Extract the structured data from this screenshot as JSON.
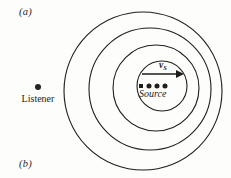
{
  "figure": {
    "background_color": "#fdfdfc",
    "stroke_color": "#211e1c",
    "panel_a_label": "(a)",
    "panel_b_label": "(b)"
  },
  "listener": {
    "label": "Listener",
    "dot_color": "#26221f",
    "x": 38,
    "y": 86
  },
  "source": {
    "label": "Source",
    "velocity_symbol": "v",
    "velocity_subscript": "S",
    "dot_color": "#211d1b",
    "x": 162,
    "y": 86
  },
  "arrow": {
    "name": "velocity-arrow",
    "x1": 142,
    "y1": 74,
    "x2": 184,
    "y2": 74,
    "color": "#1f1b19"
  },
  "chart_data": {
    "type": "scatter",
    "xlabel": "",
    "ylabel": "",
    "xlim": [
      0,
      231
    ],
    "ylim": [
      0,
      178
    ],
    "grid": false,
    "legend": "none",
    "annotations": [
      "(a)",
      "(b)",
      "Listener",
      "Source",
      "vS"
    ],
    "wavefronts": [
      {
        "name": "wavefront-4-outer",
        "cx": 143,
        "cy": 91,
        "r": 79,
        "stroke": "#211e1c",
        "stroke_width": 1.1
      },
      {
        "name": "wavefront-3",
        "cx": 150,
        "cy": 89,
        "r": 61,
        "stroke": "#211e1c",
        "stroke_width": 1.1
      },
      {
        "name": "wavefront-2",
        "cx": 156,
        "cy": 88,
        "r": 43,
        "stroke": "#211e1c",
        "stroke_width": 1.1
      },
      {
        "name": "wavefront-1-inner",
        "cx": 162,
        "cy": 86,
        "r": 25,
        "stroke": "#211e1c",
        "stroke_width": 1.1
      }
    ],
    "source_positions": [
      {
        "name": "source-origin-marker",
        "x": 141,
        "y": 86,
        "shape": "square",
        "size": 4
      },
      {
        "name": "source-position-1",
        "x": 149,
        "y": 86,
        "shape": "circle",
        "size": 3.4
      },
      {
        "name": "source-position-2",
        "x": 157,
        "y": 86,
        "shape": "circle",
        "size": 3.4
      },
      {
        "name": "source-position-3",
        "x": 165,
        "y": 86,
        "shape": "circle",
        "size": 3.4
      }
    ]
  }
}
